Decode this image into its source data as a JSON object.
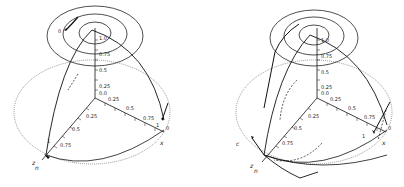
{
  "figure": {
    "panels": [
      {
        "id": "left",
        "axis_ticks_vertical": [
          "1.0",
          "0.75",
          "0.5",
          "0.25",
          "0.0"
        ],
        "axis_ticks_x": [
          "0.25",
          "0.5",
          "0.75",
          "1"
        ],
        "axis_ticks_y": [
          "0.25",
          "0.5",
          "0.75",
          "1"
        ],
        "x_label": "x",
        "origin_label_x": "0",
        "y_labels": [
          "z",
          "n"
        ],
        "marker_label": "0"
      },
      {
        "id": "right",
        "axis_ticks_vertical": [
          "1.0",
          "0.75",
          "0.5",
          "0.25",
          "0.0"
        ],
        "axis_ticks_x": [
          "0.25",
          "0.5",
          "0.75",
          "1"
        ],
        "axis_ticks_y": [
          "0.25",
          "0.5",
          "0.75",
          "1"
        ],
        "x_label": "x",
        "origin_label_x": "0",
        "y_labels": [
          "z",
          "n"
        ],
        "side_label": "c"
      }
    ]
  }
}
